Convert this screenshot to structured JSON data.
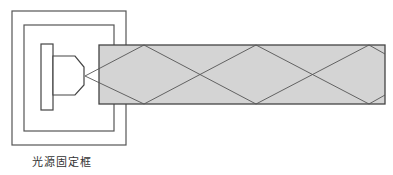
{
  "diagram": {
    "labels": {
      "frame": "光源固定框"
    },
    "components": [
      {
        "name": "outer-frame",
        "type": "rectangle"
      },
      {
        "name": "inner-frame",
        "type": "rectangle"
      },
      {
        "name": "light-source-base",
        "type": "rectangle"
      },
      {
        "name": "light-source-head",
        "type": "polygon"
      },
      {
        "name": "light-guide",
        "type": "rectangle",
        "fill": "#d3d3d3"
      },
      {
        "name": "light-rays",
        "type": "zigzag-reflections"
      }
    ],
    "colors": {
      "stroke": "#444444",
      "guide_fill": "#d4d4d4",
      "background": "#ffffff"
    }
  }
}
